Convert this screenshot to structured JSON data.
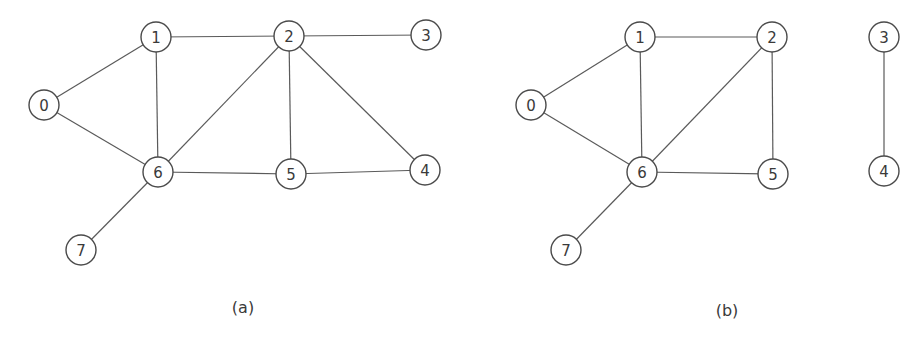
{
  "graphs": [
    {
      "id": "a",
      "caption": "(a)",
      "caption_pos": [
        243,
        307
      ],
      "nodes": [
        {
          "id": "0",
          "label": "0",
          "x": 44,
          "y": 105
        },
        {
          "id": "1",
          "label": "1",
          "x": 156,
          "y": 37
        },
        {
          "id": "2",
          "label": "2",
          "x": 289,
          "y": 36
        },
        {
          "id": "3",
          "label": "3",
          "x": 426,
          "y": 35
        },
        {
          "id": "4",
          "label": "4",
          "x": 425,
          "y": 170
        },
        {
          "id": "5",
          "label": "5",
          "x": 291,
          "y": 174
        },
        {
          "id": "6",
          "label": "6",
          "x": 158,
          "y": 172
        },
        {
          "id": "7",
          "label": "7",
          "x": 81,
          "y": 250
        }
      ],
      "edges": [
        [
          "0",
          "1"
        ],
        [
          "0",
          "6"
        ],
        [
          "1",
          "2"
        ],
        [
          "1",
          "6"
        ],
        [
          "2",
          "3"
        ],
        [
          "2",
          "6"
        ],
        [
          "2",
          "5"
        ],
        [
          "2",
          "4"
        ],
        [
          "6",
          "5"
        ],
        [
          "5",
          "4"
        ],
        [
          "6",
          "7"
        ]
      ]
    },
    {
      "id": "b",
      "caption": "(b)",
      "caption_pos": [
        727,
        310
      ],
      "nodes": [
        {
          "id": "0",
          "label": "0",
          "x": 531,
          "y": 105
        },
        {
          "id": "1",
          "label": "1",
          "x": 640,
          "y": 37
        },
        {
          "id": "2",
          "label": "2",
          "x": 772,
          "y": 37
        },
        {
          "id": "3",
          "label": "3",
          "x": 884,
          "y": 37
        },
        {
          "id": "4",
          "label": "4",
          "x": 884,
          "y": 171
        },
        {
          "id": "5",
          "label": "5",
          "x": 773,
          "y": 174
        },
        {
          "id": "6",
          "label": "6",
          "x": 642,
          "y": 172
        },
        {
          "id": "7",
          "label": "7",
          "x": 566,
          "y": 250
        }
      ],
      "edges": [
        [
          "0",
          "1"
        ],
        [
          "0",
          "6"
        ],
        [
          "1",
          "2"
        ],
        [
          "1",
          "6"
        ],
        [
          "2",
          "6"
        ],
        [
          "2",
          "5"
        ],
        [
          "6",
          "5"
        ],
        [
          "6",
          "7"
        ],
        [
          "3",
          "4"
        ]
      ]
    }
  ],
  "style": {
    "node_radius": 15,
    "edge_color": "#5a5a5a",
    "node_stroke_color": "#4a4a4a",
    "background": "#ffffff"
  }
}
